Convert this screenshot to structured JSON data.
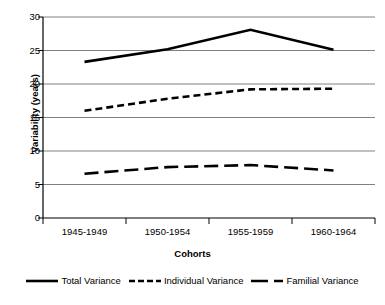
{
  "chart_data": {
    "type": "line",
    "title": "",
    "xlabel": "Cohorts",
    "ylabel": "Variability (years)",
    "categories": [
      "1945-1949",
      "1950-1954",
      "1955-1959",
      "1960-1964"
    ],
    "ylim": [
      0,
      30
    ],
    "yticks": [
      0,
      5,
      10,
      15,
      20,
      25,
      30
    ],
    "ytick_labels": [
      "0",
      "5",
      "10",
      "15",
      "20",
      "25",
      "30"
    ],
    "grid": "horizontal",
    "legend_position": "bottom",
    "series": [
      {
        "name": "Total Variance",
        "style": "solid",
        "color": "#000000",
        "values": [
          23.3,
          25.2,
          28.1,
          25.1
        ]
      },
      {
        "name": "Individual Variance",
        "style": "dashed",
        "color": "#000000",
        "values": [
          16.0,
          17.8,
          19.2,
          19.3
        ]
      },
      {
        "name": "Familial Variance",
        "style": "dash-dot",
        "color": "#000000",
        "values": [
          6.6,
          7.6,
          7.9,
          7.1
        ]
      }
    ]
  },
  "axes": {
    "y_title": "Variability (years)",
    "x_title": "Cohorts",
    "y_labels": [
      "30",
      "25",
      "20",
      "15",
      "10",
      "5",
      "0"
    ],
    "x_labels": [
      "1945-1949",
      "1950-1954",
      "1955-1959",
      "1960-1964"
    ]
  },
  "legend": {
    "items": [
      {
        "label": "Total Variance",
        "swatch": "solid-line-swatch"
      },
      {
        "label": "Individual Variance",
        "swatch": "dashed-line-swatch"
      },
      {
        "label": "Familial Variance",
        "swatch": "dash-dot-line-swatch"
      }
    ]
  },
  "colors": {
    "gridline": "#808080",
    "axis": "#000000",
    "series": "#000000",
    "background": "#ffffff"
  }
}
